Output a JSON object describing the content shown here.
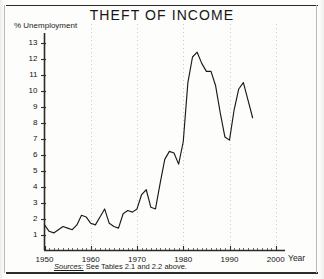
{
  "figure": {
    "title": "THEFT OF INCOME",
    "y_axis_label": "% Unemployment",
    "x_axis_label": "Year",
    "source_note_label": "Sources:",
    "source_note_text": "See Tables 2.1 and 2.2 above.",
    "line_color": "#1a1a1a",
    "grid_color": "#bdbdbd",
    "axis_color": "#2b2b2b",
    "background_color": "#fdfdfb"
  },
  "chart_data": {
    "type": "line",
    "title": "THEFT OF INCOME",
    "subtitle": "",
    "xlabel": "Year",
    "ylabel": "% Unemployment",
    "xlim": [
      1950,
      2002
    ],
    "ylim": [
      0,
      13.6
    ],
    "grid": true,
    "grid_axis": "x",
    "legend": false,
    "x_ticks": [
      1950,
      1960,
      1970,
      1980,
      1990,
      2000
    ],
    "y_ticks": [
      1,
      2,
      3,
      4,
      5,
      6,
      7,
      8,
      9,
      10,
      11,
      12,
      13
    ],
    "x_tick_labels": [
      "1950",
      "1960",
      "1970",
      "1980",
      "1990",
      "2000"
    ],
    "y_tick_labels": [
      "1",
      "2",
      "3",
      "4",
      "5",
      "6",
      "7",
      "8",
      "9",
      "10",
      "11",
      "12",
      "13"
    ],
    "annotations": [
      {
        "text": "Sources: See Tables 2.1 and 2.2 above.",
        "position": "below-axis"
      }
    ],
    "series": [
      {
        "name": "% Unemployment",
        "color": "#1a1a1a",
        "x": [
          1950,
          1951,
          1952,
          1953,
          1954,
          1955,
          1956,
          1957,
          1958,
          1959,
          1960,
          1961,
          1962,
          1963,
          1964,
          1965,
          1966,
          1967,
          1968,
          1969,
          1970,
          1971,
          1972,
          1973,
          1974,
          1975,
          1976,
          1977,
          1978,
          1979,
          1980,
          1981,
          1982,
          1983,
          1984,
          1985,
          1986,
          1987,
          1988,
          1989,
          1990,
          1991,
          1992,
          1993,
          1994,
          1995
        ],
        "values": [
          1.6,
          1.2,
          1.1,
          1.3,
          1.5,
          1.4,
          1.3,
          1.6,
          2.2,
          2.1,
          1.7,
          1.6,
          2.1,
          2.6,
          1.7,
          1.5,
          1.4,
          2.3,
          2.5,
          2.4,
          2.6,
          3.5,
          3.8,
          2.7,
          2.6,
          4.2,
          5.7,
          6.2,
          6.1,
          5.4,
          6.8,
          10.5,
          12.1,
          12.4,
          11.7,
          11.2,
          11.2,
          10.3,
          8.6,
          7.1,
          6.9,
          8.8,
          10.1,
          10.5,
          9.4,
          8.3
        ]
      }
    ]
  }
}
